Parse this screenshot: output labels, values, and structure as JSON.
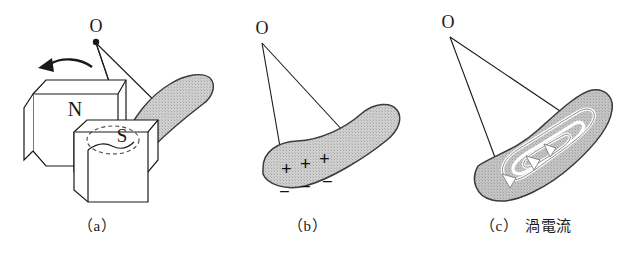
{
  "figure": {
    "background_color": "#ffffff",
    "ink_color": "#1a1a1a",
    "plate_fill_color": "#c8c8c8",
    "plate_fill_dark_color": "#a9a9a9",
    "width": 635,
    "height": 258
  },
  "panels": [
    {
      "id": "a",
      "caption": "（a）",
      "caption_jp": "",
      "pivot_label": "O",
      "labels": {
        "north_pole": "N",
        "south_pole": "S"
      },
      "motion_arrow": "curved-left-arrow",
      "description": "Metal plate pendulum swinging between N and S magnet pole pieces"
    },
    {
      "id": "b",
      "caption": "（b）",
      "caption_jp": "",
      "pivot_label": "O",
      "charges_positive": [
        "+",
        "+",
        "+"
      ],
      "charges_negative": [
        "−",
        "−",
        "−"
      ],
      "description": "Charge separation across the swinging plate"
    },
    {
      "id": "c",
      "caption": "（c）",
      "caption_jp": "渦電流",
      "pivot_label": "O",
      "current_loop": "spiral-eddy-current-with-arrowheads",
      "description": "Eddy current spiral induced inside the plate"
    }
  ]
}
